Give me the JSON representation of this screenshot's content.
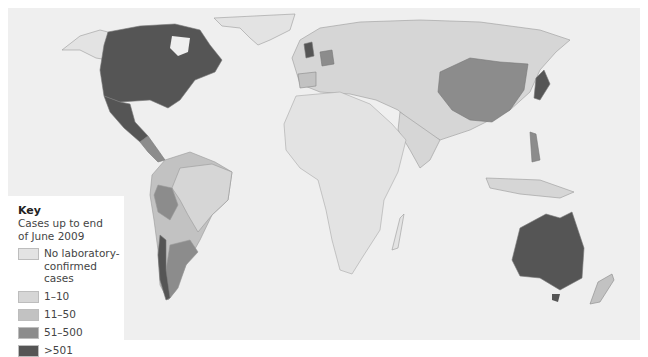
{
  "legend": {
    "title": "Key",
    "subtitle_line1": "Cases up to end",
    "subtitle_line2": "of June 2009",
    "items": [
      {
        "label_line1": "No laboratory-",
        "label_line2": "confirmed cases",
        "color": "#e3e3e3"
      },
      {
        "label_line1": "1–10",
        "label_line2": "",
        "color": "#d6d6d6"
      },
      {
        "label_line1": "11–50",
        "label_line2": "",
        "color": "#c2c2c2"
      },
      {
        "label_line1": "51–500",
        "label_line2": "",
        "color": "#8c8c8c"
      },
      {
        "label_line1": ">501",
        "label_line2": "",
        "color": "#555555"
      }
    ]
  },
  "map": {
    "ocean_color": "#efefef",
    "regions": [
      {
        "name": "United States and Canada",
        "category": ">501"
      },
      {
        "name": "Mexico",
        "category": ">501"
      },
      {
        "name": "United Kingdom",
        "category": ">501"
      },
      {
        "name": "Japan",
        "category": ">501"
      },
      {
        "name": "Australia",
        "category": ">501"
      },
      {
        "name": "Chile",
        "category": ">501"
      },
      {
        "name": "Philippines",
        "category": "51–500"
      },
      {
        "name": "China",
        "category": "51–500"
      },
      {
        "name": "Germany",
        "category": "51–500"
      },
      {
        "name": "Argentina",
        "category": "51–500"
      },
      {
        "name": "Peru",
        "category": "51–500"
      },
      {
        "name": "Spain",
        "category": "51–500"
      },
      {
        "name": "Brazil",
        "category": "11–50"
      },
      {
        "name": "Russia",
        "category": "1–10"
      },
      {
        "name": "Africa",
        "category": "No laboratory-confirmed cases"
      },
      {
        "name": "Greenland",
        "category": "No laboratory-confirmed cases"
      },
      {
        "name": "New Zealand",
        "category": "11–50"
      }
    ]
  }
}
